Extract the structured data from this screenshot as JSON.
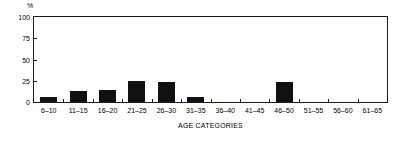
{
  "chart_data": {
    "type": "bar",
    "title": "",
    "xlabel": "AGE CATEGORIES",
    "ylabel": "%",
    "ylim": [
      0,
      100
    ],
    "yticks": [
      0,
      25,
      50,
      75,
      100
    ],
    "grid": false,
    "legend": null,
    "bar_color": "#111111",
    "axis_color": "#1a1a1a",
    "background": "#ffffff",
    "categories": [
      "6–10",
      "11–15",
      "16–20",
      "21–25",
      "26–30",
      "31–35",
      "36–40",
      "41–45",
      "46–50",
      "51–55",
      "56–60",
      "61–65"
    ],
    "values": [
      6,
      13,
      14,
      25,
      23,
      6,
      0,
      0,
      24,
      0,
      0,
      0
    ]
  }
}
